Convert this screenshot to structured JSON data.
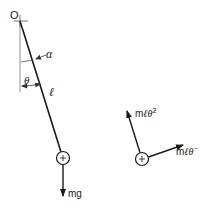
{
  "diagram": {
    "pivot_label": "O",
    "angle_alpha_label": "α",
    "angle_theta_label": "θ",
    "length_label": "ℓ",
    "gravity_force_label": "mg",
    "centripetal_label_prefix": "m",
    "centripetal_label_l": "ℓ",
    "centripetal_label_theta": "θ̇",
    "centripetal_label_sup": "2",
    "tangential_label_prefix": "m",
    "tangential_label_l": "ℓ",
    "tangential_label_theta": "θ̈",
    "bob_symbol": "+",
    "colors": {
      "line": "#1a1a1a",
      "thin": "#555555",
      "text": "#222222"
    }
  }
}
